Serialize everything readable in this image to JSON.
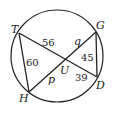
{
  "diagram": {
    "type": "circle-intersecting-chords",
    "stroke_color": "#222222",
    "background": "#ffffff",
    "circle": {
      "cx": 57,
      "cy": 56,
      "r": 46
    },
    "points": {
      "T": {
        "label": "T",
        "x": 19,
        "y": 33
      },
      "G": {
        "label": "G",
        "x": 96,
        "y": 32
      },
      "D": {
        "label": "D",
        "x": 97,
        "y": 77
      },
      "H": {
        "label": "H",
        "x": 29,
        "y": 92
      },
      "U": {
        "label": "U",
        "x": 66,
        "y": 59
      }
    },
    "segments": [
      {
        "from": "T",
        "to": "D"
      },
      {
        "from": "H",
        "to": "G"
      },
      {
        "from": "T",
        "to": "H"
      },
      {
        "from": "G",
        "to": "D"
      }
    ],
    "segment_labels": {
      "TU": "56",
      "UG": "q",
      "GD": "45",
      "TH": "60",
      "HU": "p",
      "UD": "39"
    }
  }
}
